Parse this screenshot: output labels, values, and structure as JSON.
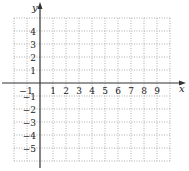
{
  "chart_data": {
    "type": "scatter",
    "title": "",
    "xlabel": "x",
    "ylabel": "y",
    "xlim": [
      -2,
      10
    ],
    "ylim": [
      -6,
      5
    ],
    "grid": true,
    "grid_style": "dotted",
    "x_ticks": [
      -1,
      1,
      2,
      3,
      4,
      5,
      6,
      7,
      8,
      9
    ],
    "y_ticks": [
      4,
      3,
      2,
      1,
      -1,
      -2,
      -3,
      -4,
      -5
    ],
    "x_tick_labels": [
      "−1",
      "1",
      "2",
      "3",
      "4",
      "5",
      "6",
      "7",
      "8",
      "9"
    ],
    "y_tick_labels": [
      "4",
      "3",
      "2",
      "1",
      "−1",
      "−2",
      "−3",
      "−4",
      "−5"
    ],
    "series": [],
    "colors": {
      "axis": "#333333",
      "grid": "#9a9a9a"
    }
  }
}
